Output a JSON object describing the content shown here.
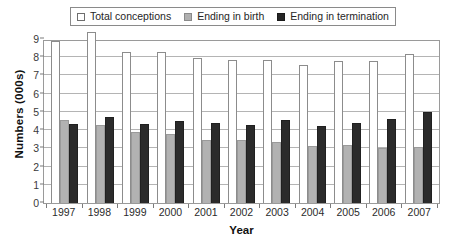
{
  "chart_data": {
    "type": "bar",
    "title": "",
    "xlabel": "Year",
    "ylabel": "Numbers (000s)",
    "categories": [
      "1997",
      "1998",
      "1999",
      "2000",
      "2001",
      "2002",
      "2003",
      "2004",
      "2005",
      "2006",
      "2007"
    ],
    "series": [
      {
        "name": "Total conceptions",
        "color": "#ffffff",
        "values": [
          8.9,
          9.3,
          8.3,
          8.3,
          7.95,
          7.85,
          7.85,
          7.6,
          7.8,
          7.8,
          8.2
        ]
      },
      {
        "name": "Ending in birth",
        "color": "#b2b2b2",
        "values": [
          4.55,
          4.3,
          3.9,
          3.8,
          3.45,
          3.45,
          3.35,
          3.15,
          3.2,
          3.0,
          3.1
        ]
      },
      {
        "name": "Ending in termination",
        "color": "#2b2b2b",
        "values": [
          4.35,
          4.7,
          4.35,
          4.5,
          4.4,
          4.3,
          4.55,
          4.2,
          4.4,
          4.6,
          5.0
        ]
      }
    ],
    "ylim": [
      0,
      9
    ],
    "yticks": [
      "0",
      "1",
      "2",
      "3",
      "4",
      "5",
      "6",
      "7",
      "8",
      "9"
    ],
    "grid": true,
    "legend_position": "top"
  },
  "legend": {
    "items": [
      {
        "label": "Total conceptions",
        "swatch": "white"
      },
      {
        "label": "Ending in birth",
        "swatch": "gray"
      },
      {
        "label": "Ending in termination",
        "swatch": "black"
      }
    ]
  },
  "axes": {
    "y_title": "Numbers (000s)",
    "x_title": "Year"
  }
}
